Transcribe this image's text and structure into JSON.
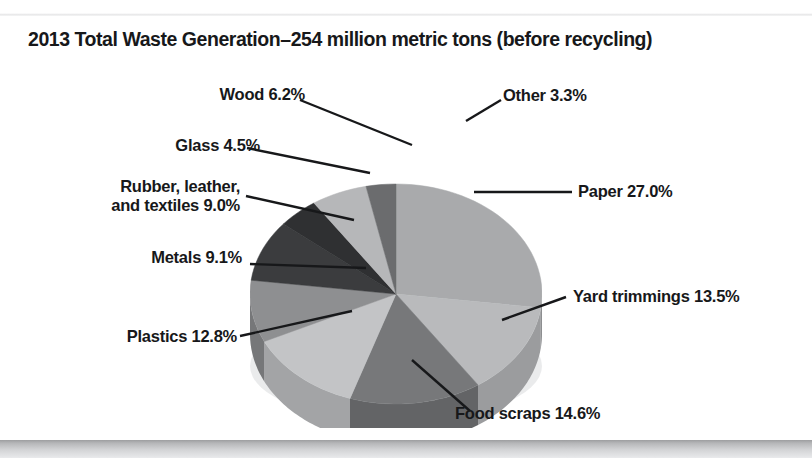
{
  "figure": {
    "title": "2013 Total Waste Generation–254 million metric tons (before recycling)",
    "background_color": "#ffffff",
    "text_color": "#17181a",
    "top_rule_color": "#e2e3e4",
    "bottom_rule_color": "#b6b7b9"
  },
  "chart_data": {
    "type": "pie",
    "title": "2013 Total Waste Generation–254 million metric tons (before recycling)",
    "subtitle": "",
    "xlabel": "",
    "ylabel": "",
    "total_label": "254 million metric tons",
    "year": "2013",
    "units": "percent",
    "legend_position": "callout-labels",
    "grid": false,
    "three_d": true,
    "start_angle_deg": -90,
    "direction": "clockwise",
    "categories": [
      "Paper",
      "Yard trimmings",
      "Food scraps",
      "Plastics",
      "Metals",
      "Rubber, leather, and textiles",
      "Glass",
      "Wood",
      "Other"
    ],
    "values": [
      27.0,
      13.5,
      14.6,
      12.8,
      9.1,
      9.0,
      4.5,
      6.2,
      3.3
    ],
    "slices": [
      {
        "label": "Paper",
        "value": 27.0,
        "label_text": "Paper 27.0%",
        "color": "#a9aaac",
        "side_color": "#8d8e90",
        "label_side": "right"
      },
      {
        "label": "Yard trimmings",
        "value": 13.5,
        "label_text": "Yard trimmings 13.5%",
        "color": "#b9babc",
        "side_color": "#9b9c9e",
        "label_side": "right"
      },
      {
        "label": "Food scraps",
        "value": 14.6,
        "label_text": "Food scraps 14.6%",
        "color": "#77787a",
        "side_color": "#636466",
        "label_side": "right"
      },
      {
        "label": "Plastics",
        "value": 12.8,
        "label_text": "Plastics 12.8%",
        "color": "#c3c4c6",
        "side_color": "#a3a4a6",
        "label_side": "left"
      },
      {
        "label": "Metals",
        "value": 9.1,
        "label_text": "Metals 9.1%",
        "color": "#8e8f91",
        "side_color": "#767779",
        "label_side": "left"
      },
      {
        "label": "Rubber, leather, and textiles",
        "value": 9.0,
        "label_text": "Rubber, leather,\nand textiles 9.0%",
        "label_line1": "Rubber, leather,",
        "label_line2": "and textiles 9.0%",
        "color": "#3b3c3e",
        "side_color": "#2e2f31",
        "label_side": "left"
      },
      {
        "label": "Glass",
        "value": 4.5,
        "label_text": "Glass 4.5%",
        "color": "#2f3032",
        "side_color": "#242527",
        "label_side": "left"
      },
      {
        "label": "Wood",
        "value": 6.2,
        "label_text": "Wood 6.2%",
        "color": "#b6b7b9",
        "side_color": "#98999b",
        "label_side": "left"
      },
      {
        "label": "Other",
        "value": 3.3,
        "label_text": "Other 3.3%",
        "color": "#6b6c6e",
        "side_color": "#58595b",
        "label_side": "right"
      }
    ]
  }
}
